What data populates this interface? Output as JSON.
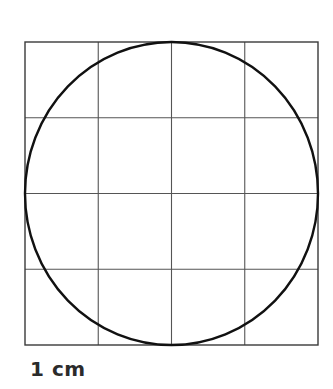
{
  "figure": {
    "title": "",
    "type": "geometry-diagram",
    "background_color": "#ffffff",
    "canvas": {
      "width": 333,
      "height": 389
    },
    "grid": {
      "name": "centimetre-grid",
      "columns": 4,
      "rows": 4,
      "left": 25,
      "top": 42,
      "right": 318,
      "bottom": 345,
      "cell_width": 73.25,
      "cell_height": 75.75,
      "line_color": "#555555",
      "line_width": 1.1,
      "border_color": "#3a3a3a",
      "border_width": 1.4,
      "vertical_line_x": [
        25,
        98.25,
        171.5,
        244.75,
        318
      ],
      "horizontal_line_y": [
        42,
        117.75,
        193.5,
        269.25,
        345
      ]
    },
    "circle": {
      "name": "inscribed-circle",
      "center_x": 171.5,
      "center_y": 193.5,
      "radius_x": 146.5,
      "radius_y": 151.5,
      "stroke_color": "#111111",
      "stroke_width": 2.4,
      "fill": "none"
    },
    "scale_label": {
      "text": "1 cm",
      "color": "#2b2b2b",
      "font_size_px": 20,
      "bold": true
    }
  },
  "chart_data": {
    "type": "diagram",
    "xlabel": "",
    "ylabel": "",
    "grid": true,
    "legend": "none",
    "annotations": [
      "1 cm"
    ],
    "shapes": [
      {
        "shape": "square-grid",
        "rows": 4,
        "columns": 4,
        "cell_side_cm": 1,
        "total_side_cm": 4
      },
      {
        "shape": "circle",
        "diameter_cm": 4,
        "radius_cm": 2,
        "inscribed_in": "square-grid"
      }
    ]
  }
}
